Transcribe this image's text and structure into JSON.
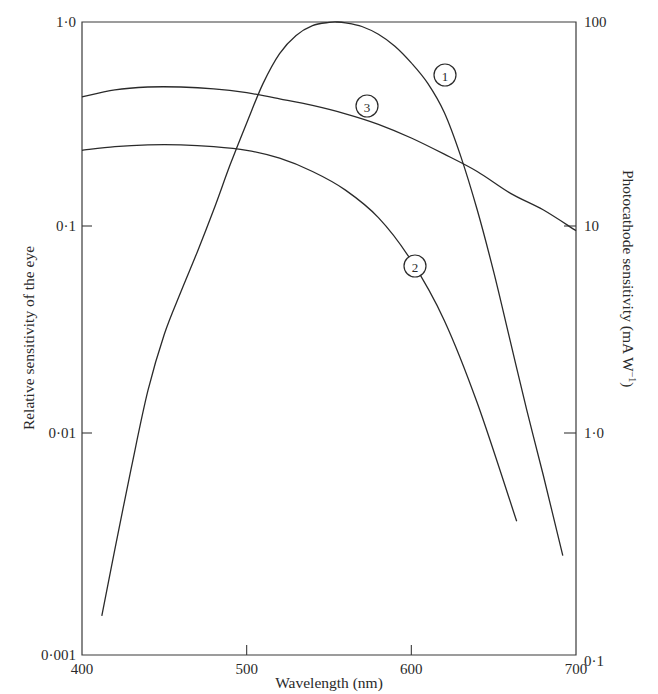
{
  "chart_data": {
    "type": "line",
    "title": "",
    "xlabel": "Wavelength (nm)",
    "ylabel": "Relative sensitivity of the eye",
    "y2label": "Photocathode sensitivity (mA W⁻¹)",
    "xlim": [
      400,
      700
    ],
    "ylim": [
      0.001,
      1.0
    ],
    "y2lim": [
      0.1,
      100
    ],
    "yscale": "log",
    "grid": false,
    "legend": "none (curves labelled with circled numbers 1, 2, 3)",
    "x_ticks": [
      "400",
      "500",
      "600",
      "700"
    ],
    "y_ticks": [
      "0·001",
      "0·01",
      "0·1",
      "1·0"
    ],
    "y2_ticks": [
      "0·1",
      "1·0",
      "10",
      "100"
    ],
    "series": [
      {
        "name": "1",
        "axis": "left",
        "description": "Relative sensitivity of the eye",
        "x": [
          412,
          420,
          430,
          440,
          450,
          460,
          470,
          480,
          490,
          500,
          510,
          520,
          530,
          540,
          550,
          555,
          560,
          570,
          580,
          590,
          600,
          610,
          620,
          630,
          640,
          650,
          660,
          670,
          680,
          692
        ],
        "values": [
          0.0015,
          0.003,
          0.007,
          0.016,
          0.03,
          0.048,
          0.075,
          0.12,
          0.2,
          0.32,
          0.5,
          0.7,
          0.86,
          0.96,
          0.995,
          1.0,
          0.99,
          0.95,
          0.87,
          0.76,
          0.63,
          0.5,
          0.36,
          0.22,
          0.12,
          0.06,
          0.028,
          0.013,
          0.0065,
          0.0028
        ]
      },
      {
        "name": "2",
        "axis": "right",
        "description": "Photocathode sensitivity",
        "x": [
          400,
          420,
          440,
          460,
          480,
          500,
          520,
          540,
          560,
          580,
          600,
          620,
          640,
          664
        ],
        "values": [
          23.5,
          24.5,
          25,
          25,
          24.5,
          23.5,
          21.5,
          18.5,
          15,
          11,
          6.8,
          3.5,
          1.4,
          0.4
        ]
      },
      {
        "name": "3",
        "axis": "right",
        "description": "Photocathode sensitivity",
        "x": [
          400,
          420,
          440,
          460,
          480,
          500,
          520,
          540,
          560,
          580,
          600,
          620,
          640,
          660,
          680,
          700
        ],
        "values": [
          43,
          46.5,
          48,
          48,
          47,
          45,
          42,
          39,
          35.5,
          31.5,
          27,
          22.5,
          18.5,
          14.5,
          12,
          9.5
        ]
      }
    ],
    "annotations": [
      {
        "text": "1",
        "x": 622,
        "y_left": 0.58
      },
      {
        "text": "2",
        "x": 615,
        "y_left": 0.06
      },
      {
        "text": "3",
        "x": 572,
        "y_left": 0.35
      }
    ]
  },
  "axes": {
    "xlabel": "Wavelength (nm)",
    "ylabel": "Relative sensitivity of the eye",
    "y2label": "Photocathode sensitivity (mA W",
    "y2label_sup": "−1",
    "y2label_end": ")",
    "x_ticks": [
      {
        "value": 400,
        "label": "400"
      },
      {
        "value": 500,
        "label": "500"
      },
      {
        "value": 600,
        "label": "600"
      },
      {
        "value": 700,
        "label": "700"
      }
    ],
    "y_ticks": [
      {
        "value": 1.0,
        "label": "1·0"
      },
      {
        "value": 0.1,
        "label": "0·1"
      },
      {
        "value": 0.01,
        "label": "0·01"
      },
      {
        "value": 0.001,
        "label": "0·001"
      }
    ],
    "y2_ticks": [
      {
        "value": 100,
        "label": "100"
      },
      {
        "value": 10,
        "label": "10"
      },
      {
        "value": 1,
        "label": "1·0"
      },
      {
        "value": 0.1,
        "label": "0·1"
      }
    ]
  },
  "colors": {
    "ink": "#2a2a2a",
    "background": "#ffffff"
  }
}
